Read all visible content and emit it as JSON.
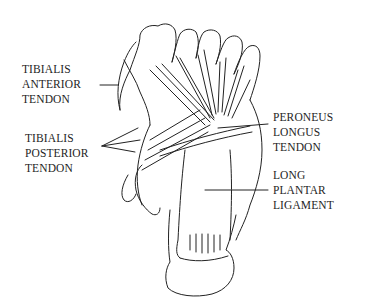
{
  "figure": {
    "line_color": "#222222",
    "background": "#ffffff"
  },
  "labels": [
    {
      "id": "tibialis-anterior",
      "lines": [
        "TIBIALIS",
        "ANTERIOR",
        "TENDON"
      ]
    },
    {
      "id": "tibialis-posterior",
      "lines": [
        "TIBIALIS",
        "POSTERIOR",
        "TENDON"
      ]
    },
    {
      "id": "peroneus-longus",
      "lines": [
        "PERONEUS",
        "LONGUS",
        "TENDON"
      ]
    },
    {
      "id": "long-plantar-ligament",
      "lines": [
        "LONG",
        "PLANTAR",
        "LIGAMENT"
      ]
    }
  ]
}
